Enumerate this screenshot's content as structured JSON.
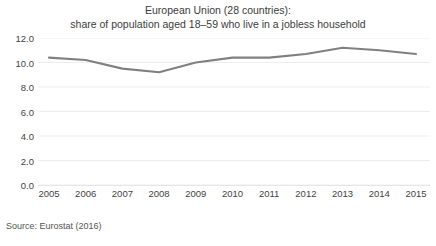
{
  "chart_data": {
    "type": "line",
    "title": "European Union (28 countries):",
    "subtitle": "share of population aged 18–59 who live in a jobless household",
    "xlabel": "",
    "ylabel": "",
    "categories": [
      "2005",
      "2006",
      "2007",
      "2008",
      "2009",
      "2010",
      "2011",
      "2012",
      "2013",
      "2014",
      "2015"
    ],
    "x": [
      2005,
      2006,
      2007,
      2008,
      2009,
      2010,
      2011,
      2012,
      2013,
      2014,
      2015
    ],
    "values": [
      10.4,
      10.2,
      9.5,
      9.2,
      10.0,
      10.4,
      10.4,
      10.7,
      11.2,
      11.0,
      10.7
    ],
    "series": [
      {
        "name": "share of population aged 18-59 in jobless household",
        "values": [
          10.4,
          10.2,
          9.5,
          9.2,
          10.0,
          10.4,
          10.4,
          10.7,
          11.2,
          11.0,
          10.7
        ],
        "color": "#808080"
      }
    ],
    "ylim": [
      0.0,
      12.0
    ],
    "ytick_values": [
      12.0,
      10.0,
      8.0,
      6.0,
      4.0,
      2.0,
      0.0
    ],
    "ytick_labels": [
      "12.0",
      "10.0",
      "8.0",
      "6.0",
      "4.0",
      "2.0",
      "0.0"
    ],
    "xtick_labels": [
      "2005",
      "2006",
      "2007",
      "2008",
      "2009",
      "2010",
      "2011",
      "2012",
      "2013",
      "2014",
      "2015"
    ],
    "grid": true,
    "legend": false,
    "legend_position": "none",
    "annotations": [
      "Source: Eurostat (2016)"
    ]
  },
  "title": {
    "line1": "European Union (28 countries):",
    "line2": "share of population aged 18–59 who live in a jobless household"
  },
  "footer": {
    "source": "Source: Eurostat (2016)"
  },
  "style": {
    "line_color": "#808080",
    "grid_color": "#ededed",
    "text_color": "#3f3f3f",
    "background": "#ffffff"
  }
}
